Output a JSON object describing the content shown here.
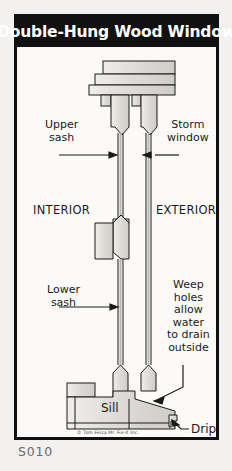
{
  "banner": {
    "title": "Double-Hung Wood Window"
  },
  "caption": {
    "code": "S010"
  },
  "credit": {
    "text": "© Tom Feiza Mr. Fix-It Inc."
  },
  "labels": {
    "upper_sash": "Upper\nsash",
    "storm_window": "Storm\nwindow",
    "interior": "INTERIOR",
    "exterior": "EXTERIOR",
    "lower_sash": "Lower\nsash",
    "weep_holes": "Weep\nholes\nallow\nwater\nto drain\noutside",
    "sill": "Sill",
    "drip": "Drip"
  },
  "colors": {
    "banner_bg": "#111111",
    "banner_text": "#ffffff",
    "page_bg": "#f2f1ef",
    "card_bg": "#fbfaf8",
    "ink": "#1a1a1a",
    "wood_fill": "#dcdad6",
    "wood_fill_light": "#e8e6e2",
    "caption_text": "#6a6a6a"
  }
}
